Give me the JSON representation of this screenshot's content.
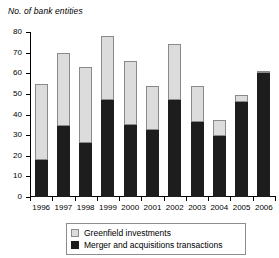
{
  "chart_data": {
    "type": "bar",
    "subtype": "stacked-vertical",
    "title": "No. of bank entities",
    "xlabel": "",
    "ylabel": "No. of bank entities",
    "ylim": [
      0,
      80
    ],
    "ytick_values": [
      0,
      10,
      20,
      30,
      40,
      50,
      60,
      70,
      80
    ],
    "ytick_labels": [
      "0",
      "10",
      "20",
      "30",
      "40",
      "50",
      "60",
      "70",
      "80"
    ],
    "grid": false,
    "legend_position": "bottom-center",
    "categories": [
      "1996",
      "1997",
      "1998",
      "1999",
      "2000",
      "2001",
      "2002",
      "2003",
      "2004",
      "2005",
      "2006"
    ],
    "series": [
      {
        "name": "Merger and acquisitions transactions",
        "color": "#1d1d1d",
        "values": [
          18,
          34.5,
          26,
          47,
          35,
          32.5,
          47,
          36.5,
          29.5,
          46,
          60
        ]
      },
      {
        "name": "Greenfield investments",
        "color": "#dcdcdc",
        "values": [
          37,
          35.5,
          37,
          31,
          31,
          21.5,
          27,
          17.5,
          8,
          3.5,
          1
        ]
      }
    ],
    "totals": [
      55,
      70,
      63,
      78,
      66,
      54,
      74,
      54,
      37.5,
      49.5,
      61
    ],
    "stack_order": [
      "Merger and acquisitions transactions",
      "Greenfield investments"
    ]
  },
  "legend": {
    "items": [
      {
        "label": "Greenfield investments",
        "swatch": "light-gray-square"
      },
      {
        "label": "Merger and acquisitions transactions",
        "swatch": "dark-square"
      }
    ]
  }
}
